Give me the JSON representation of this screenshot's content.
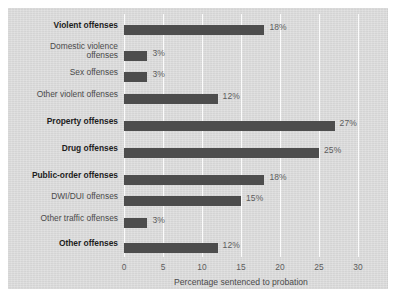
{
  "figure": {
    "panel_color": "#d9d9d9",
    "bar_color": "#4d4d4d",
    "gridline_color": "#fbfbfb",
    "text_color": "#4a4a4a"
  },
  "chart_data": {
    "type": "bar",
    "orientation": "horizontal",
    "title": "",
    "xlabel": "Percentage sentenced to probation",
    "ylabel": "",
    "xlim": [
      0,
      30
    ],
    "xticks": [
      0,
      5,
      10,
      15,
      20,
      25,
      30
    ],
    "xtick_labels": [
      "0",
      "5",
      "10",
      "15",
      "20",
      "25",
      "30"
    ],
    "grid": true,
    "legend": "none",
    "categories": [
      "Violent offenses",
      "Domestic violence offenses",
      "Sex offenses",
      "Other violent offenses",
      "Property offenses",
      "Drug offenses",
      "Public-order offenses",
      "DWI/DUI offenses",
      "Other traffic offenses",
      "Other offenses"
    ],
    "values": [
      18,
      3,
      3,
      12,
      27,
      25,
      18,
      15,
      3,
      12
    ],
    "value_labels": [
      "18%",
      "3%",
      "3%",
      "12%",
      "27%",
      "25%",
      "18%",
      "15%",
      "3%",
      "12%"
    ],
    "bars": [
      {
        "label": "Violent offenses",
        "label_lines": "Violent offenses",
        "value": 18,
        "value_label": "18%",
        "emphasis": "major"
      },
      {
        "label": "Domestic violence offenses",
        "label_lines": "Domestic violence\noffenses",
        "value": 3,
        "value_label": "3%",
        "emphasis": "sub"
      },
      {
        "label": "Sex offenses",
        "label_lines": "Sex offenses",
        "value": 3,
        "value_label": "3%",
        "emphasis": "sub"
      },
      {
        "label": "Other violent offenses",
        "label_lines": "Other violent offenses",
        "value": 12,
        "value_label": "12%",
        "emphasis": "sub"
      },
      {
        "label": "Property offenses",
        "label_lines": "Property offenses",
        "value": 27,
        "value_label": "27%",
        "emphasis": "major"
      },
      {
        "label": "Drug offenses",
        "label_lines": "Drug offenses",
        "value": 25,
        "value_label": "25%",
        "emphasis": "major"
      },
      {
        "label": "Public-order offenses",
        "label_lines": "Public-order offenses",
        "value": 18,
        "value_label": "18%",
        "emphasis": "major"
      },
      {
        "label": "DWI/DUI offenses",
        "label_lines": "DWI/DUI offenses",
        "value": 15,
        "value_label": "15%",
        "emphasis": "sub"
      },
      {
        "label": "Other traffic offenses",
        "label_lines": "Other traffic offenses",
        "value": 3,
        "value_label": "3%",
        "emphasis": "sub"
      },
      {
        "label": "Other offenses",
        "label_lines": "Other offenses",
        "value": 12,
        "value_label": "12%",
        "emphasis": "major"
      }
    ]
  }
}
